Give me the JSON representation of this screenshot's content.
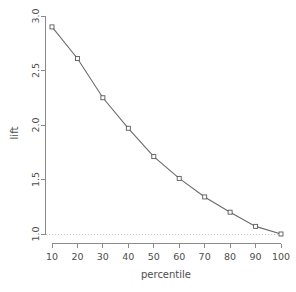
{
  "chart_data": {
    "type": "line",
    "title": "",
    "subtitle": "",
    "xlabel": "percentile",
    "ylabel": "lift",
    "x": [
      10,
      20,
      30,
      40,
      50,
      60,
      70,
      80,
      90,
      100
    ],
    "values": [
      2.9,
      2.61,
      2.25,
      1.97,
      1.71,
      1.51,
      1.34,
      1.2,
      1.07,
      1.0
    ],
    "series": [
      {
        "name": "lift",
        "values": [
          2.9,
          2.61,
          2.25,
          1.97,
          1.71,
          1.51,
          1.34,
          1.2,
          1.07,
          1.0
        ]
      }
    ],
    "xlim": [
      10,
      100
    ],
    "ylim": [
      1.0,
      3.0
    ],
    "xticks": [
      10,
      20,
      30,
      40,
      50,
      60,
      70,
      80,
      90,
      100
    ],
    "xticklabels": [
      "10",
      "20",
      "30",
      "40",
      "50",
      "60",
      "70",
      "80",
      "90",
      "100"
    ],
    "yticks": [
      1.0,
      1.5,
      2.0,
      2.5,
      3.0
    ],
    "yticklabels": [
      "1.0",
      "1.5",
      "2.0",
      "2.5",
      "3.0"
    ],
    "grid": false,
    "legend": null,
    "annotations": [
      {
        "name": "baseline-reference-line",
        "kind": "horizontal-dotted-line",
        "value": 1.0,
        "color": "#c9c9c9"
      }
    ],
    "colors": {
      "line": "#6b6b6b",
      "point_stroke": "#5a5a5a",
      "point_fill": "#ffffff",
      "axis": "#8a8a8a",
      "text": "#4d4d4d",
      "reference_line": "#c9c9c9",
      "background": "#ffffff"
    },
    "marker": "open-square",
    "ylabel_rotation": -90
  }
}
